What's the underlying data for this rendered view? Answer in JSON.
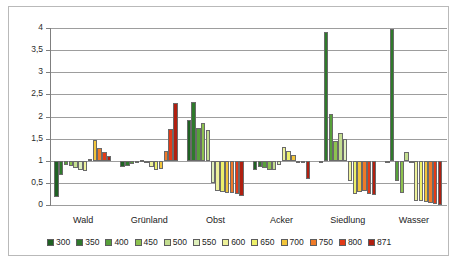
{
  "chart_data": {
    "type": "bar",
    "title": "",
    "subtitle": "",
    "xlabel": "",
    "ylabel": "",
    "categories": [
      "Wald",
      "Grünland",
      "Obst",
      "Acker",
      "Siedlung",
      "Wasser"
    ],
    "ylim": [
      0,
      4
    ],
    "yticks": [
      0,
      0.5,
      1,
      1.5,
      2,
      2.5,
      3,
      3.5,
      4
    ],
    "ytick_labels": [
      "0",
      "0,5",
      "1",
      "1,5",
      "2",
      "2,5",
      "3",
      "3,5",
      "4"
    ],
    "baseline": 1,
    "grid": true,
    "legend_position": "bottom",
    "series": [
      {
        "name": "300",
        "color": "#1f6123",
        "values": [
          0.19,
          0.85,
          1.93,
          0.8,
          0.99,
          0.99
        ]
      },
      {
        "name": "350",
        "color": "#2f7a2c",
        "values": [
          0.68,
          0.88,
          2.33,
          0.85,
          3.92,
          3.97
        ]
      },
      {
        "name": "400",
        "color": "#57a03a",
        "values": [
          0.91,
          0.92,
          1.75,
          0.83,
          2.05,
          0.55
        ]
      },
      {
        "name": "450",
        "color": "#8dc24f",
        "values": [
          0.88,
          0.96,
          1.86,
          0.8,
          1.44,
          0.27
        ]
      },
      {
        "name": "500",
        "color": "#c3dd8f",
        "values": [
          0.84,
          1.02,
          1.69,
          0.78,
          1.62,
          1.19
        ]
      },
      {
        "name": "550",
        "color": "#dff0bb",
        "values": [
          0.8,
          0.96,
          0.5,
          0.9,
          1.5,
          1.0
        ]
      },
      {
        "name": "600",
        "color": "#eef29a",
        "values": [
          0.77,
          0.86,
          0.31,
          1.31,
          0.55,
          0.1
        ]
      },
      {
        "name": "650",
        "color": "#edf06a",
        "values": [
          1.05,
          0.78,
          0.3,
          1.22,
          0.25,
          0.09
        ]
      },
      {
        "name": "700",
        "color": "#f2c53b",
        "values": [
          1.46,
          0.82,
          0.28,
          1.14,
          0.3,
          0.07
        ]
      },
      {
        "name": "750",
        "color": "#ef7a28",
        "values": [
          1.28,
          1.22,
          0.26,
          1.0,
          0.32,
          0.04
        ]
      },
      {
        "name": "800",
        "color": "#e23a17",
        "values": [
          1.2,
          1.72,
          0.24,
          0.96,
          0.25,
          0.02
        ]
      },
      {
        "name": "871",
        "color": "#b01f10",
        "values": [
          1.1,
          2.31,
          0.2,
          0.59,
          0.22,
          0.01
        ]
      }
    ]
  },
  "legend": {
    "items": [
      {
        "label": "300"
      },
      {
        "label": "350"
      },
      {
        "label": "400"
      },
      {
        "label": "450"
      },
      {
        "label": "500"
      },
      {
        "label": "550"
      },
      {
        "label": "600"
      },
      {
        "label": "650"
      },
      {
        "label": "700"
      },
      {
        "label": "750"
      },
      {
        "label": "800"
      },
      {
        "label": "871"
      }
    ]
  },
  "colors": {
    "grid": "#9d9d9d",
    "axis": "#7f7f7f",
    "frame": "#b9b9b9",
    "background": "#ffffff",
    "text": "#222222"
  }
}
